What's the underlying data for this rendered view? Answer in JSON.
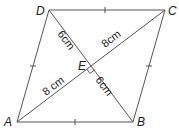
{
  "diagram": {
    "colors": {
      "line": "#555555",
      "text": "#222222",
      "background": "#ffffff"
    },
    "vertices": {
      "A": {
        "label": "A",
        "x": 17,
        "y": 122
      },
      "B": {
        "label": "B",
        "x": 133,
        "y": 122
      },
      "C": {
        "label": "C",
        "x": 165,
        "y": 10
      },
      "D": {
        "label": "D",
        "x": 49,
        "y": 10
      },
      "E": {
        "label": "E",
        "x": 91,
        "y": 66
      }
    },
    "measurements": {
      "DE": "6cm",
      "EC": "8cm",
      "AE": "8 cm",
      "EB": "6cm"
    },
    "annotations": {
      "equal_side_ticks": [
        "AB",
        "BC",
        "CD",
        "DA"
      ],
      "right_angle_at": "E"
    }
  }
}
